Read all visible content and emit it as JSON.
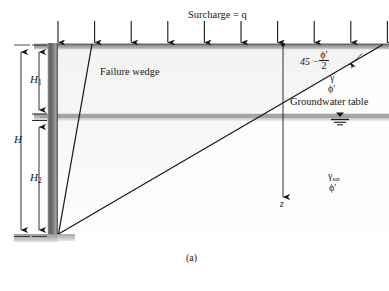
{
  "figure": {
    "caption": "(a)",
    "surcharge_label": "Surcharge = q",
    "wedge_label": "Failure wedge",
    "groundwater_label": "Groundwater table",
    "depth_axis_label": "z",
    "height_total_label": "H",
    "height_upper_label": "H",
    "height_upper_sub": "1",
    "height_lower_label": "H",
    "height_lower_sub": "2",
    "angle_prefix": "45 −",
    "angle_numerator": "ϕ′",
    "angle_denominator": "2",
    "upper_soil_unit_weight": "γ",
    "upper_soil_friction": "ϕ′",
    "lower_soil_unit_weight": "γ",
    "lower_soil_unit_weight_sub": "sat",
    "lower_soil_friction": "ϕ′",
    "surcharge_arrow_count": 10,
    "colors": {
      "line": "#181818",
      "wall_dark": "#6b6b6b",
      "wall_mid": "#8f8f8f",
      "ground_band": "#8a8a8a",
      "water_band": "#a8a8a8",
      "background": "#ffffff"
    }
  }
}
